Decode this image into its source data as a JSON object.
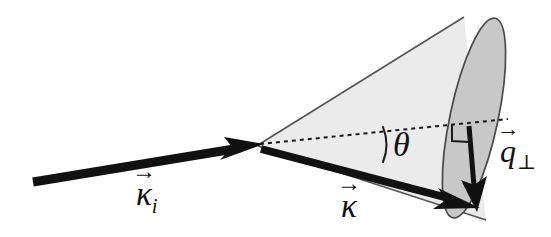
{
  "figure": {
    "kind": "vector-scattering-cone-diagram",
    "canvas": {
      "width": 551,
      "height": 237
    },
    "background_color": "#ffffff"
  },
  "labels": {
    "incident_vector": {
      "symbol": "κ",
      "subscript": "i",
      "vector_arrow": "→",
      "name": "incident wave vector"
    },
    "scattered_vector": {
      "symbol": "κ",
      "subscript": "",
      "vector_arrow": "→",
      "name": "scattered wave vector"
    },
    "angle": {
      "symbol": "θ",
      "name": "scattering half-angle"
    },
    "transverse_vector": {
      "symbol": "q",
      "perp": "⊥",
      "vector_arrow": "→",
      "name": "transverse momentum transfer"
    }
  },
  "colors": {
    "stroke": "#2b2b2b",
    "arrow_fill": "#111111",
    "cone_body_fill": "#ebebeb",
    "cone_base_fill": "#c8c8c8",
    "cone_outline": "#555555",
    "dashed_axis": "#1a1a1a",
    "text": "#111111"
  },
  "geometry": {
    "apex": {
      "x": 258,
      "y": 145
    },
    "incident_start": {
      "x": 33,
      "y": 182
    },
    "incident_end": {
      "x": 258,
      "y": 145
    },
    "scattered_start": {
      "x": 262,
      "y": 150
    },
    "scattered_end": {
      "x": 477,
      "y": 207
    },
    "axis_dashed_start": {
      "x": 260,
      "y": 144
    },
    "axis_dashed_end": {
      "x": 508,
      "y": 119
    },
    "transverse_start": {
      "x": 470,
      "y": 127
    },
    "transverse_end": {
      "x": 477,
      "y": 207
    },
    "base_ellipse": {
      "center_x": 474,
      "center_y": 118,
      "radius_x": 24,
      "radius_y": 102,
      "rotation_deg": 12
    },
    "right_angle_marker": {
      "x": 452,
      "y": 124,
      "size": 17
    },
    "angle_arc": {
      "x": 384,
      "y": 128,
      "height": 34
    }
  },
  "elements": [
    "incident-vector-arrow",
    "cone-body",
    "cone-base-ellipse",
    "dashed-axis-line",
    "scattered-vector-arrow",
    "transverse-vector-arrow",
    "right-angle-marker",
    "angle-arc"
  ]
}
